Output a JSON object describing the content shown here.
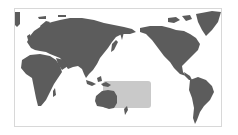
{
  "map": {
    "projection": "Pacific-centered world map",
    "colors": {
      "background": "#ffffff",
      "land": "#5c5c5c",
      "highlight_region": "#c9c9c9",
      "frame_border": "#d8d8d8"
    },
    "highlight": {
      "description": "Shaded rectangular region over the western/central Pacific including New Guinea and eastern Australia",
      "shape": "rounded-rectangle"
    },
    "landmasses": [
      "Europe",
      "Asia",
      "Africa",
      "Australia",
      "North America",
      "South America",
      "Greenland",
      "New Guinea",
      "New Zealand",
      "Japan",
      "Indonesia"
    ]
  }
}
